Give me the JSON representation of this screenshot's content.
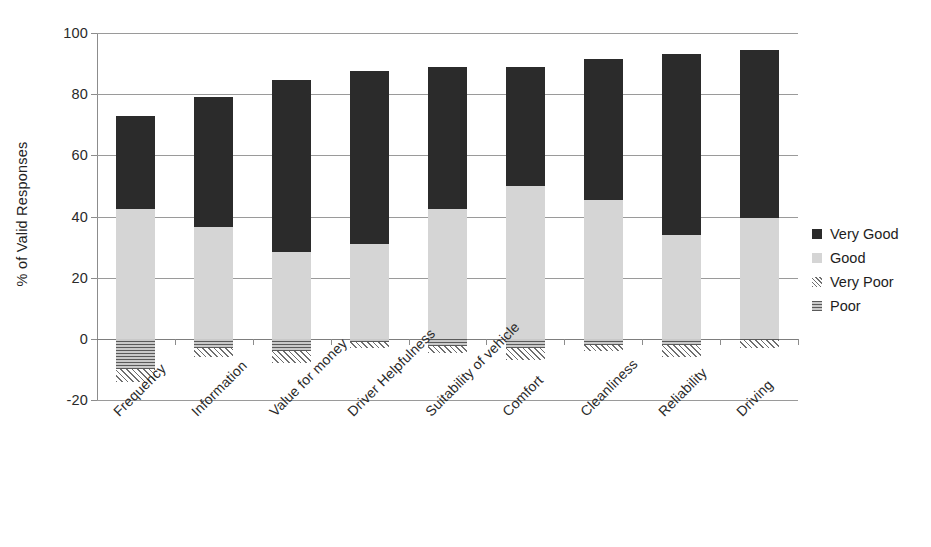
{
  "chart_data": {
    "type": "bar",
    "subtype": "stacked-bar-diverging",
    "title": "",
    "subtitle": "",
    "xlabel": "",
    "ylabel": "% of Valid Responses",
    "ylim": [
      -20,
      100
    ],
    "yticks": [
      -20,
      0,
      20,
      40,
      60,
      80,
      100
    ],
    "ytick_labels": [
      "-20",
      "0",
      "20",
      "40",
      "60",
      "80",
      "100"
    ],
    "grid": true,
    "legend_position": "right",
    "categories": [
      "Frequency",
      "Information",
      "Value for money",
      "Driver Helpfulness",
      "Suitability of vehicle",
      "Comfort",
      "Cleanliness",
      "Reliability",
      "Driving"
    ],
    "series": [
      {
        "name": "Very Good",
        "color": "#2b2b2b",
        "pattern": "solid",
        "values": [
          30.5,
          42.5,
          56.0,
          56.5,
          46.5,
          39.0,
          46.0,
          59.0,
          55.0
        ]
      },
      {
        "name": "Good",
        "color": "#d5d5d5",
        "pattern": "solid",
        "values": [
          42.5,
          36.5,
          28.5,
          31.0,
          42.5,
          50.0,
          45.5,
          34.0,
          39.5
        ]
      },
      {
        "name": "Very Poor",
        "color": "#e4e4e4",
        "pattern": "diagonal-hatch",
        "values": [
          -4.0,
          -3.0,
          -4.0,
          -2.0,
          -2.0,
          -4.0,
          -2.0,
          -4.0,
          -2.5
        ]
      },
      {
        "name": "Poor",
        "color": "#8f8f8f",
        "pattern": "horizontal-hatch",
        "values": [
          -10.0,
          -3.0,
          -4.0,
          -1.0,
          -2.5,
          -3.0,
          -2.0,
          -2.0,
          -0.5
        ]
      }
    ],
    "bar_totals_positive": [
      73.0,
      79.0,
      84.5,
      87.5,
      89.0,
      89.0,
      91.5,
      93.0,
      94.5
    ],
    "bar_totals_negative": [
      -14.0,
      -6.0,
      -8.0,
      -3.0,
      -4.5,
      -7.0,
      -4.0,
      -6.0,
      -3.0
    ]
  },
  "legend": {
    "items": [
      {
        "label": "Very Good"
      },
      {
        "label": "Good"
      },
      {
        "label": "Very Poor"
      },
      {
        "label": "Poor"
      }
    ]
  }
}
